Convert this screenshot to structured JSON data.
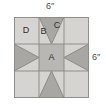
{
  "diagram": {
    "dimensions": {
      "top_label": "6″",
      "right_label": "6″"
    },
    "patch_labels": {
      "center": "A",
      "geese_side": "B",
      "geese_point": "C",
      "corner": "D"
    },
    "colors": {
      "light": "#d4d2cf",
      "medium": "#b9b7b4",
      "dark": "#a9a7a4",
      "outline": "#8a8885",
      "label_text": "#2e2e2e",
      "dim_text": "#4a4a4a",
      "background": "#ffffff"
    },
    "grid": {
      "columns": 3,
      "rows": 3,
      "unit_layout": [
        [
          "corner-square-D",
          "flying-geese-up",
          "corner-square"
        ],
        [
          "flying-geese-right",
          "center-square-A",
          "flying-geese-left"
        ],
        [
          "corner-square",
          "flying-geese-down",
          "corner-square"
        ]
      ]
    }
  }
}
